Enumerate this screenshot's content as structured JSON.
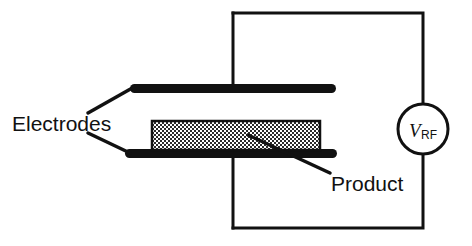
{
  "figure": {
    "background_color": "#ffffff",
    "ink_color": "#111111",
    "width": 472,
    "height": 246
  },
  "labels": {
    "electrodes": "Electrodes",
    "product": "Product",
    "source_symbol": "V",
    "source_subscript": "RF"
  },
  "components": {
    "top_electrode": {
      "name": "top-electrode",
      "shape": "rounded-bar",
      "fill": "#111111",
      "x": 130,
      "y": 84,
      "width": 206,
      "height": 9
    },
    "bottom_electrode": {
      "name": "bottom-electrode",
      "shape": "rounded-bar",
      "fill": "#111111",
      "x": 125,
      "y": 149,
      "width": 212,
      "height": 9
    },
    "product_slab": {
      "name": "product-slab",
      "shape": "hatched-rectangle",
      "fill": "checkerboard-gray",
      "stroke": "#111111",
      "x": 152,
      "y": 121,
      "width": 168,
      "height": 29
    },
    "circuit_loop": {
      "name": "circuit-wire-loop",
      "stroke": "#111111",
      "stroke_width": 3,
      "x": 232,
      "y": 13,
      "width": 191,
      "height": 215
    },
    "source": {
      "name": "rf-voltage-source",
      "shape": "circle",
      "cx": 423,
      "cy": 129,
      "r": 25,
      "stroke": "#111111",
      "stroke_width": 3
    },
    "top_lead": {
      "name": "top-electrode-lead",
      "x": 233,
      "y1": 13,
      "y2": 88
    },
    "bottom_lead": {
      "name": "bottom-electrode-lead",
      "x": 233,
      "y1": 153,
      "y2": 228
    }
  },
  "leader_lines": {
    "electrodes_upper": {
      "name": "electrodes-upper-leader",
      "x1": 88,
      "y1": 113,
      "x2": 134,
      "y2": 87
    },
    "electrodes_lower": {
      "name": "electrodes-lower-leader",
      "x1": 88,
      "y1": 133,
      "x2": 130,
      "y2": 153
    },
    "product": {
      "name": "product-leader",
      "x1": 330,
      "y1": 173,
      "x2": 248,
      "y2": 135
    }
  },
  "label_positions": {
    "electrodes": {
      "x": 12,
      "y": 131
    },
    "product": {
      "x": 331,
      "y": 191
    },
    "source_symbol": {
      "x": 410,
      "y": 136
    },
    "source_subscript": {
      "x": 421,
      "y": 139
    }
  }
}
